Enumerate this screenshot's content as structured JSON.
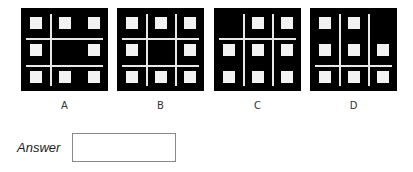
{
  "options": [
    {
      "label": "A",
      "left": 21,
      "squares": [
        [
          0,
          0
        ],
        [
          0,
          1
        ],
        [
          0,
          2
        ],
        [
          1,
          0
        ],
        [
          1,
          2
        ],
        [
          2,
          0
        ],
        [
          2,
          1
        ],
        [
          2,
          2
        ]
      ],
      "vlines": [
        1
      ],
      "hlines": [
        1,
        2
      ]
    },
    {
      "label": "B",
      "left": 117,
      "squares": [
        [
          0,
          0
        ],
        [
          0,
          1
        ],
        [
          0,
          2
        ],
        [
          1,
          0
        ],
        [
          1,
          2
        ],
        [
          2,
          0
        ],
        [
          2,
          1
        ],
        [
          2,
          2
        ]
      ],
      "vlines": [
        1,
        2
      ],
      "hlines": [
        1,
        2
      ]
    },
    {
      "label": "C",
      "left": 214,
      "squares": [
        [
          0,
          1
        ],
        [
          0,
          2
        ],
        [
          1,
          0
        ],
        [
          1,
          1
        ],
        [
          1,
          2
        ],
        [
          2,
          0
        ],
        [
          2,
          1
        ],
        [
          2,
          2
        ]
      ],
      "vlines": [
        1,
        2
      ],
      "hlines": [
        1
      ]
    },
    {
      "label": "D",
      "left": 310,
      "squares": [
        [
          0,
          0
        ],
        [
          0,
          1
        ],
        [
          1,
          0
        ],
        [
          1,
          1
        ],
        [
          1,
          2
        ],
        [
          2,
          0
        ],
        [
          2,
          1
        ],
        [
          2,
          2
        ]
      ],
      "vlines": [
        1,
        2
      ],
      "hlines": [
        2
      ]
    }
  ],
  "answer": {
    "label": "Answer",
    "value": ""
  },
  "colors": {
    "panel_bg": "#000000",
    "square": "#f2f2f2",
    "line": "#e8e8e8"
  }
}
